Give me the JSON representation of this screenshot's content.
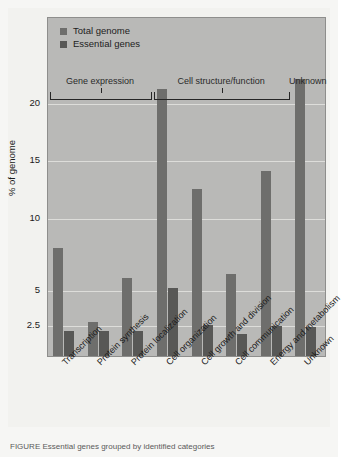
{
  "chart_data": {
    "type": "bar",
    "title": "",
    "xlabel": "",
    "ylabel": "% of genome",
    "grid": true,
    "legend_position": "top-left",
    "ylim": [
      0,
      23
    ],
    "yticks": [
      2.5,
      5,
      10,
      15,
      20
    ],
    "ytick_labels": [
      "2.5",
      "5",
      "10",
      "15",
      "20"
    ],
    "axis_note": "non-linear axis: lower region (0-5) compressed",
    "categories": [
      "Transcription",
      "Protein synthesis",
      "Protein localization",
      "Cell organization",
      "Cell growth and division",
      "Cell communication",
      "Energy and metabolism",
      "Unknown"
    ],
    "series": [
      {
        "name": "Total genome",
        "color": "#6e6e6c",
        "values": [
          8.0,
          2.8,
          5.9,
          21.3,
          12.6,
          6.2,
          14.1,
          22.2
        ]
      },
      {
        "name": "Essential genes",
        "color": "#585856",
        "values": [
          2.1,
          2.1,
          2.1,
          5.2,
          2.6,
          1.8,
          2.5,
          2.4
        ]
      }
    ],
    "groups": [
      {
        "label": "Gene expression",
        "categories": [
          "Transcription",
          "Protein synthesis",
          "Protein localization"
        ]
      },
      {
        "label": "Cell structure/function",
        "categories": [
          "Cell organization",
          "Cell growth and division",
          "Cell communication",
          "Energy and metabolism"
        ]
      },
      {
        "label": "Unknown",
        "categories": [
          "Unknown"
        ]
      }
    ]
  },
  "legend": {
    "items": [
      {
        "label": "Total genome",
        "color": "#6e6e6c"
      },
      {
        "label": "Essential genes",
        "color": "#585856"
      }
    ]
  },
  "axis": {
    "y_label": "% of genome",
    "y_ticks": [
      "20",
      "15",
      "10",
      "5",
      "2.5"
    ]
  },
  "groups": {
    "labels": [
      "Gene expression",
      "Cell structure/function",
      "Unknown"
    ]
  },
  "caption": {
    "text": "FIGURE     Essential genes grouped by identified categories"
  },
  "colors": {
    "plot_background": "#b9b9b7",
    "page_background": "#f2f2ef",
    "gridline": "#e3e3e0",
    "total_genome": "#6e6e6c",
    "essential_genes": "#585856",
    "text": "#1b1b1b"
  }
}
